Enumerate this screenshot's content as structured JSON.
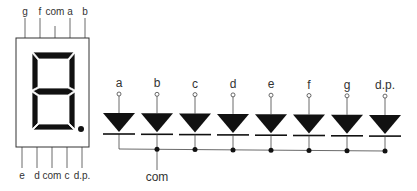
{
  "display": {
    "top_pins": [
      "g",
      "f",
      "com",
      "a",
      "b"
    ],
    "bottom_pins": [
      "e",
      "d",
      "com",
      "c",
      "d.p."
    ]
  },
  "schematic": {
    "anodes": [
      "a",
      "b",
      "c",
      "d",
      "e",
      "f",
      "g",
      "d.p."
    ],
    "common_label": "com"
  }
}
